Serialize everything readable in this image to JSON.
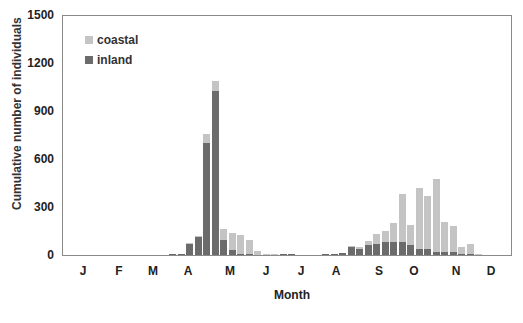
{
  "chart_data": {
    "type": "bar",
    "stacked": true,
    "title": "",
    "xlabel": "Month",
    "ylabel": "Cumulative number of individuals",
    "ylim": [
      0,
      1500
    ],
    "yticks": [
      0,
      300,
      600,
      900,
      1200,
      1500
    ],
    "xticks": [
      "J",
      "F",
      "M",
      "A",
      "M",
      "J",
      "J",
      "A",
      "S",
      "O",
      "N",
      "D"
    ],
    "grid": false,
    "legend_position": "upper-left",
    "colors": {
      "coastal": "#c4c4c4",
      "inland": "#6b6b6b"
    },
    "series": [
      {
        "name": "coastal",
        "values": [
          0,
          0,
          0,
          0,
          0,
          0,
          0,
          0,
          0,
          0,
          0,
          0,
          0,
          0,
          5,
          10,
          60,
          60,
          70,
          110,
          120,
          90,
          25,
          5,
          5,
          0,
          0,
          0,
          0,
          0,
          0,
          0,
          0,
          5,
          10,
          30,
          60,
          70,
          120,
          300,
          130,
          380,
          330,
          460,
          190,
          160,
          45,
          60,
          5,
          0,
          0,
          0
        ]
      },
      {
        "name": "inland",
        "values": [
          0,
          0,
          0,
          0,
          0,
          0,
          0,
          0,
          0,
          0,
          0,
          0,
          5,
          5,
          70,
          110,
          700,
          1030,
          95,
          30,
          5,
          5,
          0,
          0,
          0,
          5,
          5,
          0,
          0,
          0,
          5,
          5,
          10,
          50,
          40,
          60,
          70,
          80,
          80,
          80,
          60,
          40,
          40,
          20,
          20,
          20,
          5,
          5,
          0,
          0,
          0,
          0
        ]
      }
    ]
  },
  "chart": {
    "y_axis_label": "Cumulative number of individuals",
    "x_axis_label": "Month",
    "legend": [
      {
        "label": "coastal",
        "color": "#c4c4c4"
      },
      {
        "label": "inland",
        "color": "#6b6b6b"
      }
    ],
    "yticks": [
      "1500",
      "1200",
      "900",
      "600",
      "300",
      "0"
    ],
    "xticks": [
      "J",
      "F",
      "M",
      "A",
      "M",
      "J",
      "J",
      "A",
      "S",
      "O",
      "N",
      "D"
    ]
  }
}
